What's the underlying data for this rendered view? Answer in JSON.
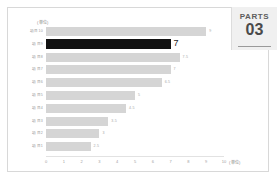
{
  "parts_panel": {
    "label": "PARTS",
    "number": "03"
  },
  "chart_data": {
    "type": "bar",
    "orientation": "horizontal",
    "title": "",
    "xlabel": "",
    "ylabel": "",
    "unit_top": "(単位)",
    "unit_right": "(単位)",
    "xlim": [
      0,
      10
    ],
    "grid": false,
    "legend": false,
    "x_ticks": [
      "0",
      "1",
      "2",
      "3",
      "4",
      "5",
      "6",
      "7",
      "8",
      "9",
      "10"
    ],
    "categories": [
      "項目10",
      "項目9",
      "項目8",
      "項目7",
      "項目6",
      "項目5",
      "項目4",
      "項目3",
      "項目2",
      "項目1"
    ],
    "values": [
      9,
      7,
      7.5,
      7,
      6.5,
      5,
      4.5,
      3.5,
      3,
      2.5
    ],
    "value_labels": [
      "9",
      "7",
      "7.5",
      "7",
      "6.5",
      "5",
      "4.5",
      "3.5",
      "3",
      "2.5"
    ],
    "highlight_index": 1,
    "colors": {
      "bar": "#d5d5d5",
      "highlight": "#121212",
      "label": "#9b9b9b",
      "value": "#a8a8a8",
      "axis": "#e2e2e2",
      "panel_bg": "#f0f0f0"
    }
  }
}
